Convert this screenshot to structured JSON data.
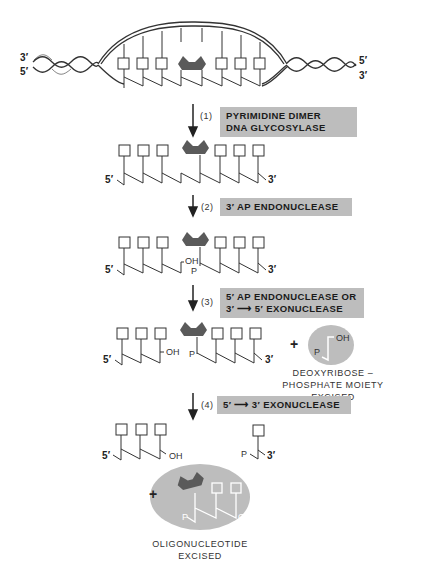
{
  "diagram": {
    "top_duplex": {
      "left_labels": [
        "3′",
        "5′"
      ],
      "right_labels": [
        "5′",
        "3′"
      ]
    },
    "steps": [
      {
        "number": "(1)",
        "enzyme_lines": [
          "PYRIMIDINE DIMER",
          "DNA GLYCOSYLASE"
        ]
      },
      {
        "number": "(2)",
        "enzyme_lines": [
          "3′ AP ENDONUCLEASE"
        ]
      },
      {
        "number": "(3)",
        "enzyme_lines": [
          "5′ AP ENDONUCLEASE OR",
          "3′ ⟶ 5′ EXONUCLEASE"
        ]
      },
      {
        "number": "(4)",
        "enzyme_lines": [
          "5′ ⟶ 3′ EXONUCLEASE"
        ]
      }
    ],
    "strand_labels": {
      "five_prime": "5′",
      "three_prime": "3′",
      "oh": "OH",
      "p": "P"
    },
    "byproducts": {
      "plus": "+",
      "deoxyribose": {
        "lines": [
          "DEOXYRIBOSE –",
          "PHOSPHATE MOIETY EXCISED"
        ],
        "p": "P",
        "oh": "OH"
      },
      "oligonucleotide": {
        "lines": [
          "OLIGONUCLEOTIDE",
          "EXCISED"
        ],
        "p": "P",
        "oh": "OH"
      }
    },
    "colors": {
      "enzyme_box": "#bdbdbd",
      "dimer": "#5a5a5a",
      "excised_ellipse": "#bdbdbd",
      "line": "#222222"
    }
  }
}
